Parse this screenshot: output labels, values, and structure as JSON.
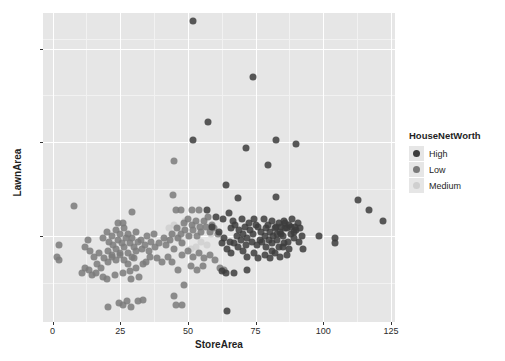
{
  "chart_data": {
    "type": "scatter",
    "title": "",
    "xlabel": "StoreArea",
    "ylabel": "LawnArea",
    "xlim": [
      -3.5,
      126.5
    ],
    "ylim": [
      5.4,
      21.9
    ],
    "x_ticks": [
      0,
      25,
      50,
      75,
      100,
      125
    ],
    "y_ticks": [
      10,
      15,
      20
    ],
    "x_minor_ticks": [
      12.5,
      37.5,
      62.5,
      87.5,
      112.5
    ],
    "y_minor_ticks": [
      7.5,
      12.5,
      17.5,
      20.5
    ],
    "grid": true,
    "legend": {
      "title": "HouseNetWorth",
      "position": "right",
      "entries": [
        {
          "name": "High",
          "color": "#3c3c3c"
        },
        {
          "name": "Low",
          "color": "#7a7a7a"
        },
        {
          "name": "Medium",
          "color": "#cfcfcf"
        }
      ]
    },
    "colors": {
      "panel_background": "#e6e6e6",
      "gridline_major": "#ffffff",
      "gridline_minor": "#f2f2f2",
      "axis_text": "#2b2b2b",
      "plot_background": "#ffffff"
    },
    "point_size": 7,
    "point_opacity": 0.85,
    "series": [
      {
        "name": "High",
        "color": "#3c3c3c",
        "points": [
          [
            52.0,
            21.5
          ],
          [
            74.0,
            18.5
          ],
          [
            57.5,
            16.1
          ],
          [
            52.0,
            15.1
          ],
          [
            82.5,
            15.1
          ],
          [
            90.0,
            14.9
          ],
          [
            71.5,
            14.7
          ],
          [
            79.5,
            13.8
          ],
          [
            64.0,
            12.7
          ],
          [
            82.5,
            12.1
          ],
          [
            68.5,
            12.0
          ],
          [
            113.0,
            11.9
          ],
          [
            57.0,
            11.4
          ],
          [
            117.0,
            11.4
          ],
          [
            122.0,
            10.8
          ],
          [
            65.0,
            11.2
          ],
          [
            63.0,
            10.9
          ],
          [
            66.5,
            10.8
          ],
          [
            70.0,
            10.9
          ],
          [
            72.5,
            10.7
          ],
          [
            74.5,
            10.9
          ],
          [
            76.0,
            10.5
          ],
          [
            78.0,
            10.9
          ],
          [
            79.5,
            10.6
          ],
          [
            81.0,
            10.8
          ],
          [
            82.0,
            10.4
          ],
          [
            83.5,
            10.7
          ],
          [
            84.5,
            10.5
          ],
          [
            85.5,
            10.8
          ],
          [
            86.5,
            10.4
          ],
          [
            87.5,
            10.6
          ],
          [
            88.5,
            10.9
          ],
          [
            89.5,
            10.5
          ],
          [
            90.5,
            10.7
          ],
          [
            91.5,
            10.4
          ],
          [
            66.0,
            10.4
          ],
          [
            67.5,
            10.6
          ],
          [
            69.0,
            10.3
          ],
          [
            71.0,
            10.5
          ],
          [
            73.0,
            10.3
          ],
          [
            75.0,
            10.6
          ],
          [
            77.0,
            10.2
          ],
          [
            79.0,
            10.4
          ],
          [
            80.5,
            10.2
          ],
          [
            82.5,
            10.5
          ],
          [
            84.0,
            10.2
          ],
          [
            86.0,
            10.4
          ],
          [
            88.0,
            10.1
          ],
          [
            90.0,
            10.3
          ],
          [
            92.0,
            10.0
          ],
          [
            68.0,
            10.0
          ],
          [
            70.5,
            10.1
          ],
          [
            72.0,
            9.9
          ],
          [
            74.0,
            10.1
          ],
          [
            76.5,
            9.8
          ],
          [
            78.5,
            10.0
          ],
          [
            80.0,
            9.8
          ],
          [
            81.5,
            10.0
          ],
          [
            83.0,
            9.8
          ],
          [
            85.0,
            10.0
          ],
          [
            87.0,
            9.7
          ],
          [
            89.0,
            9.9
          ],
          [
            91.0,
            9.7
          ],
          [
            63.5,
            9.9
          ],
          [
            65.5,
            9.7
          ],
          [
            67.0,
            9.6
          ],
          [
            69.5,
            9.8
          ],
          [
            71.5,
            9.5
          ],
          [
            73.5,
            9.7
          ],
          [
            75.5,
            9.5
          ],
          [
            77.5,
            9.7
          ],
          [
            79.0,
            9.4
          ],
          [
            81.0,
            9.6
          ],
          [
            83.5,
            9.4
          ],
          [
            85.5,
            9.6
          ],
          [
            87.5,
            9.3
          ],
          [
            98.5,
            10.0
          ],
          [
            104.5,
            9.9
          ],
          [
            104.5,
            9.6
          ],
          [
            92.5,
            9.3
          ],
          [
            60.5,
            11.0
          ],
          [
            59.0,
            10.5
          ],
          [
            61.5,
            10.2
          ],
          [
            62.5,
            9.6
          ],
          [
            64.5,
            9.3
          ],
          [
            66.0,
            9.1
          ],
          [
            68.5,
            9.4
          ],
          [
            70.5,
            9.2
          ],
          [
            72.0,
            8.9
          ],
          [
            74.5,
            9.1
          ],
          [
            76.0,
            8.8
          ],
          [
            78.5,
            9.0
          ],
          [
            80.5,
            8.8
          ],
          [
            82.0,
            9.1
          ],
          [
            84.0,
            8.9
          ],
          [
            86.5,
            9.0
          ],
          [
            72.0,
            8.2
          ],
          [
            64.0,
            8.0
          ],
          [
            62.5,
            8.1
          ],
          [
            67.0,
            8.0
          ],
          [
            64.5,
            6.0
          ],
          [
            84.5,
            10.1
          ],
          [
            86.0,
            10.7
          ],
          [
            88.0,
            10.5
          ],
          [
            89.0,
            10.2
          ],
          [
            85.0,
            9.4
          ],
          [
            83.0,
            10.1
          ],
          [
            81.0,
            9.2
          ]
        ]
      },
      {
        "name": "Low",
        "color": "#7a7a7a",
        "points": [
          [
            8.0,
            11.6
          ],
          [
            29.5,
            11.3
          ],
          [
            2.5,
            9.5
          ],
          [
            1.5,
            8.9
          ],
          [
            2.5,
            8.7
          ],
          [
            13.0,
            9.8
          ],
          [
            18.5,
            9.9
          ],
          [
            12.0,
            9.4
          ],
          [
            14.0,
            9.2
          ],
          [
            20.0,
            10.2
          ],
          [
            22.0,
            10.0
          ],
          [
            23.5,
            10.3
          ],
          [
            25.0,
            10.1
          ],
          [
            26.5,
            10.4
          ],
          [
            28.0,
            10.1
          ],
          [
            29.5,
            9.9
          ],
          [
            31.0,
            10.2
          ],
          [
            32.5,
            9.8
          ],
          [
            34.0,
            9.5
          ],
          [
            21.0,
            9.7
          ],
          [
            22.5,
            9.5
          ],
          [
            24.0,
            9.8
          ],
          [
            25.5,
            9.6
          ],
          [
            27.0,
            9.9
          ],
          [
            28.5,
            9.6
          ],
          [
            30.0,
            9.4
          ],
          [
            31.5,
            9.7
          ],
          [
            33.0,
            9.3
          ],
          [
            20.5,
            9.2
          ],
          [
            22.0,
            9.0
          ],
          [
            23.5,
            9.3
          ],
          [
            25.0,
            9.1
          ],
          [
            26.5,
            9.4
          ],
          [
            28.0,
            9.1
          ],
          [
            29.5,
            8.9
          ],
          [
            31.0,
            9.2
          ],
          [
            19.0,
            8.8
          ],
          [
            20.5,
            8.6
          ],
          [
            22.0,
            8.9
          ],
          [
            23.5,
            8.7
          ],
          [
            25.0,
            9.0
          ],
          [
            26.5,
            8.7
          ],
          [
            28.0,
            8.5
          ],
          [
            30.0,
            8.8
          ],
          [
            17.0,
            9.1
          ],
          [
            15.5,
            8.9
          ],
          [
            16.5,
            8.5
          ],
          [
            18.0,
            8.3
          ],
          [
            13.5,
            8.2
          ],
          [
            12.0,
            8.3
          ],
          [
            11.0,
            8.0
          ],
          [
            14.5,
            7.9
          ],
          [
            16.0,
            8.0
          ],
          [
            18.5,
            7.8
          ],
          [
            20.0,
            7.7
          ],
          [
            23.0,
            7.9
          ],
          [
            26.0,
            8.0
          ],
          [
            28.5,
            8.1
          ],
          [
            31.0,
            8.3
          ],
          [
            33.5,
            8.5
          ],
          [
            35.5,
            9.2
          ],
          [
            36.5,
            9.7
          ],
          [
            38.0,
            9.4
          ],
          [
            42.0,
            9.5
          ],
          [
            43.5,
            9.8
          ],
          [
            45.0,
            9.3
          ],
          [
            46.5,
            9.9
          ],
          [
            48.0,
            9.6
          ],
          [
            44.0,
            10.1
          ],
          [
            46.0,
            10.4
          ],
          [
            47.5,
            10.1
          ],
          [
            49.0,
            10.3
          ],
          [
            50.5,
            10.0
          ],
          [
            52.0,
            10.3
          ],
          [
            53.5,
            10.0
          ],
          [
            55.0,
            10.2
          ],
          [
            56.5,
            10.5
          ],
          [
            58.0,
            10.2
          ],
          [
            59.5,
            10.4
          ],
          [
            61.0,
            10.1
          ],
          [
            48.5,
            10.7
          ],
          [
            50.0,
            10.9
          ],
          [
            51.5,
            10.6
          ],
          [
            53.0,
            10.8
          ],
          [
            54.5,
            10.5
          ],
          [
            56.0,
            10.8
          ],
          [
            57.5,
            11.0
          ],
          [
            59.0,
            10.6
          ],
          [
            45.5,
            11.4
          ],
          [
            47.5,
            11.4
          ],
          [
            45.0,
            14.0
          ],
          [
            44.5,
            12.2
          ],
          [
            48.0,
            9.0
          ],
          [
            50.0,
            9.2
          ],
          [
            52.0,
            8.9
          ],
          [
            54.0,
            9.1
          ],
          [
            56.0,
            8.8
          ],
          [
            58.0,
            9.0
          ],
          [
            60.0,
            8.7
          ],
          [
            51.0,
            8.4
          ],
          [
            53.5,
            8.2
          ],
          [
            55.5,
            8.4
          ],
          [
            46.5,
            8.2
          ],
          [
            48.5,
            7.4
          ],
          [
            20.5,
            6.2
          ],
          [
            24.5,
            6.4
          ],
          [
            26.0,
            6.3
          ],
          [
            27.5,
            6.5
          ],
          [
            29.0,
            6.2
          ],
          [
            31.5,
            6.5
          ],
          [
            33.5,
            6.6
          ],
          [
            45.0,
            6.8
          ],
          [
            45.5,
            6.3
          ],
          [
            48.0,
            6.3
          ],
          [
            62.0,
            8.3
          ],
          [
            63.5,
            8.2
          ],
          [
            41.0,
            9.9
          ],
          [
            39.5,
            9.6
          ],
          [
            37.5,
            10.1
          ],
          [
            36.0,
            8.9
          ],
          [
            34.5,
            8.6
          ],
          [
            32.0,
            7.8
          ],
          [
            29.0,
            7.7
          ],
          [
            35.0,
            10.0
          ],
          [
            24.0,
            10.7
          ],
          [
            26.0,
            10.7
          ],
          [
            38.5,
            8.8
          ],
          [
            40.5,
            8.6
          ],
          [
            42.5,
            8.9
          ],
          [
            44.0,
            8.6
          ],
          [
            51.5,
            11.4
          ],
          [
            54.0,
            11.4
          ]
        ]
      },
      {
        "name": "Medium",
        "color": "#cfcfcf",
        "points": [
          [
            45.0,
            10.6
          ],
          [
            47.0,
            10.4
          ],
          [
            49.0,
            10.8
          ],
          [
            46.0,
            9.9
          ],
          [
            48.0,
            9.7
          ],
          [
            50.0,
            10.0
          ],
          [
            52.5,
            10.6
          ],
          [
            44.5,
            10.1
          ],
          [
            43.0,
            10.4
          ],
          [
            42.0,
            9.8
          ],
          [
            55.0,
            9.7
          ],
          [
            57.0,
            9.5
          ],
          [
            53.0,
            9.4
          ],
          [
            51.0,
            9.3
          ],
          [
            58.5,
            10.1
          ]
        ]
      }
    ]
  }
}
